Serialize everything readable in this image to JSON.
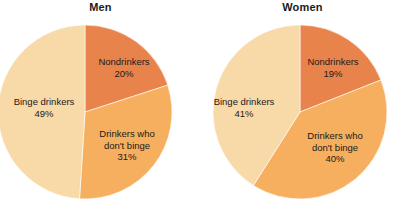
{
  "figure": {
    "background_color": "#FFFFFF",
    "width": 403,
    "height": 209
  },
  "palette": {
    "nondrinkers_color": "#E8834C",
    "drinkers_no_binge_color": "#F5AF5E",
    "binge_drinkers_color": "#F8D9A8",
    "label_text_color": "#1B1B1B",
    "title_text_color": "#1B1B1B"
  },
  "charts": {
    "men": {
      "title": "Men",
      "slices": [
        {
          "label": "Nondrinkers",
          "pct_text": "20%",
          "value": 20,
          "color": "#E8834C"
        },
        {
          "label_line1": "Drinkers who",
          "label_line2": "don't binge",
          "pct_text": "31%",
          "value": 31,
          "color": "#F5AF5E"
        },
        {
          "label": "Binge drinkers",
          "pct_text": "49%",
          "value": 49,
          "color": "#F8D9A8"
        }
      ]
    },
    "women": {
      "title": "Women",
      "slices": [
        {
          "label": "Nondrinkers",
          "pct_text": "19%",
          "value": 19,
          "color": "#E8834C"
        },
        {
          "label_line1": "Drinkers who",
          "label_line2": "don't binge",
          "pct_text": "40%",
          "value": 40,
          "color": "#F5AF5E"
        },
        {
          "label": "Binge drinkers",
          "pct_text": "41%",
          "value": 41,
          "color": "#F8D9A8"
        }
      ]
    }
  },
  "chart_data": [
    {
      "type": "pie",
      "title": "Men",
      "categories": [
        "Nondrinkers",
        "Drinkers who don't binge",
        "Binge drinkers"
      ],
      "values": [
        20,
        31,
        49
      ],
      "value_labels": [
        "20%",
        "31%",
        "49%"
      ],
      "colors": [
        "#E8834C",
        "#F5AF5E",
        "#F8D9A8"
      ],
      "start_angle_deg": 0,
      "direction": "clockwise",
      "labels_inside": true,
      "legend": "none",
      "xlabel": "",
      "ylabel": ""
    },
    {
      "type": "pie",
      "title": "Women",
      "categories": [
        "Nondrinkers",
        "Drinkers who don't binge",
        "Binge drinkers"
      ],
      "values": [
        19,
        40,
        41
      ],
      "value_labels": [
        "19%",
        "40%",
        "41%"
      ],
      "colors": [
        "#E8834C",
        "#F5AF5E",
        "#F8D9A8"
      ],
      "start_angle_deg": 0,
      "direction": "clockwise",
      "labels_inside": true,
      "legend": "none",
      "xlabel": "",
      "ylabel": ""
    }
  ]
}
